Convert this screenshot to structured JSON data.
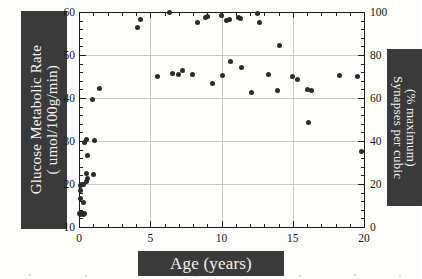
{
  "figure": {
    "xlabel": "Age (years)",
    "ylabel_left_line1": "Glucose Metabolic Rate",
    "ylabel_left_line2": "( umol/100g/min)",
    "ylabel_right_line1": "Synapses per cubic",
    "ylabel_right_line2": "(% maximum)",
    "highlight_color": "#3a3a3a",
    "highlight_text_color": "#f2f2f0",
    "marker_color": "#2b2b2b",
    "grid_color": "#c9c9c4",
    "axis_color": "#1b1b1b"
  },
  "axes": {
    "x_ticks": [
      "0",
      "5",
      "10",
      "15",
      "20"
    ],
    "y_left_ticks": [
      "60",
      "50",
      "40",
      "30",
      "20",
      "10"
    ],
    "y_right_ticks": [
      "100",
      "80",
      "60",
      "40",
      "20",
      "0"
    ]
  },
  "chart_data": {
    "type": "scatter",
    "title": "",
    "xlabel": "Age (years)",
    "ylabel": "Glucose Metabolic Rate ( umol/100g/min)",
    "ylabel_secondary": "Synapses per cubic (% maximum)",
    "xlim": [
      0,
      20
    ],
    "ylim": [
      10,
      60
    ],
    "ylim_secondary": [
      0,
      100
    ],
    "grid": true,
    "legend": "none",
    "x_ticks": [
      0,
      5,
      10,
      15,
      20
    ],
    "y_ticks": [
      10,
      20,
      30,
      40,
      50,
      60
    ],
    "y_ticks_secondary": [
      0,
      20,
      40,
      60,
      80,
      100
    ],
    "series": [
      {
        "name": "Glucose metabolic rate",
        "marker": "filled-circle",
        "points": [
          [
            0.05,
            13.2
          ],
          [
            0.12,
            13.0
          ],
          [
            0.18,
            13.1
          ],
          [
            0.25,
            13.1
          ],
          [
            0.32,
            13.0
          ],
          [
            0.4,
            13.2
          ],
          [
            0.3,
            15.6
          ],
          [
            0.12,
            16.6
          ],
          [
            0.1,
            18.4
          ],
          [
            0.08,
            19.6
          ],
          [
            0.2,
            19.9
          ],
          [
            0.3,
            20.0
          ],
          [
            0.55,
            20.6
          ],
          [
            0.6,
            21.2
          ],
          [
            0.52,
            22.4
          ],
          [
            1.05,
            22.2
          ],
          [
            0.62,
            26.7
          ],
          [
            0.4,
            29.7
          ],
          [
            0.55,
            30.4
          ],
          [
            1.1,
            30.1
          ],
          [
            0.95,
            39.6
          ],
          [
            1.45,
            42.2
          ],
          [
            4.1,
            56.3
          ],
          [
            4.35,
            58.3
          ],
          [
            6.35,
            60.0
          ],
          [
            8.35,
            57.6
          ],
          [
            8.85,
            58.8
          ],
          [
            9.05,
            59.0
          ],
          [
            10.0,
            59.2
          ],
          [
            10.35,
            58.1
          ],
          [
            10.55,
            58.2
          ],
          [
            11.2,
            58.8
          ],
          [
            11.35,
            58.6
          ],
          [
            12.55,
            59.7
          ],
          [
            12.7,
            57.6
          ],
          [
            6.55,
            45.6
          ],
          [
            7.25,
            46.3
          ],
          [
            7.0,
            45.5
          ],
          [
            7.95,
            45.5
          ],
          [
            10.1,
            45.2
          ],
          [
            10.6,
            48.6
          ],
          [
            11.4,
            47.0
          ],
          [
            12.1,
            41.2
          ],
          [
            13.3,
            45.5
          ],
          [
            14.1,
            52.2
          ],
          [
            15.3,
            44.4
          ],
          [
            16.0,
            41.9
          ],
          [
            16.35,
            41.8
          ],
          [
            16.1,
            34.4
          ],
          [
            18.25,
            45.3
          ],
          [
            19.55,
            45.1
          ],
          [
            19.8,
            27.5
          ],
          [
            5.5,
            44.9
          ],
          [
            9.35,
            43.3
          ],
          [
            13.9,
            41.7
          ],
          [
            15.0,
            45.0
          ]
        ]
      }
    ]
  }
}
